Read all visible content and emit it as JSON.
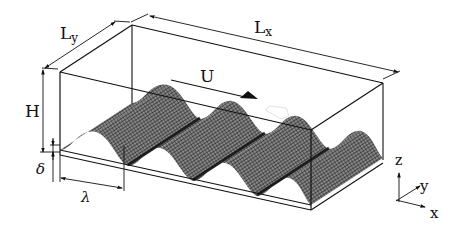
{
  "figure": {
    "type": "schematic of channel flow over wavy bottom wall",
    "labels": {
      "length_x": "L",
      "length_x_sub": "x",
      "length_y": "L",
      "length_y_sub": "y",
      "height": "H",
      "velocity": "U",
      "amplitude": "δ",
      "wavelength": "λ"
    },
    "axes": {
      "x": "x",
      "y": "y",
      "z": "z"
    },
    "wave_count": 4,
    "colors": {
      "line": "#111111",
      "mesh_dark": "#1a1a1a",
      "mesh_light": "#6e6e6e",
      "background": "#ffffff"
    }
  }
}
